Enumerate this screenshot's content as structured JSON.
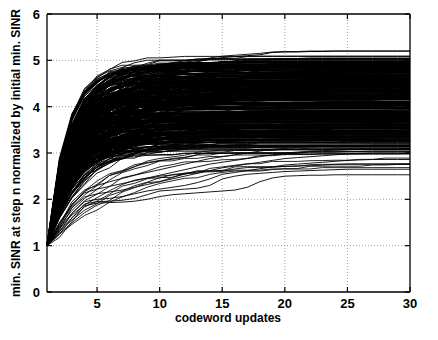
{
  "chart_data": {
    "type": "line",
    "title": "",
    "subtitle": "",
    "xlabel": "codeword updates",
    "ylabel": "min. SINR at step n normalized by initial min. SINR",
    "xlim": [
      1,
      30
    ],
    "ylim": [
      0,
      6
    ],
    "xticks": [
      5,
      10,
      15,
      20,
      25,
      30
    ],
    "xticklabels": [
      "5",
      "10",
      "15",
      "20",
      "25",
      "30"
    ],
    "yticks": [
      0,
      1,
      2,
      3,
      4,
      5,
      6
    ],
    "yticklabels": [
      "0",
      "1",
      "2",
      "3",
      "4",
      "5",
      "6"
    ],
    "grid": true,
    "grid_style": "dotted",
    "legend": "none",
    "line_color": "#000000",
    "background": "#ffffff",
    "n_series": 200,
    "series_note": "Approximately 200 overlapping monotone non-decreasing trajectories, all starting at (1, 1.0) and saturating by about step 20; they form a dense black band.",
    "x": [
      1,
      2,
      3,
      4,
      5,
      6,
      7,
      8,
      9,
      10,
      11,
      12,
      13,
      14,
      15,
      16,
      17,
      18,
      19,
      20,
      21,
      22,
      23,
      24,
      25,
      26,
      27,
      28,
      29,
      30
    ],
    "envelope_upper": [
      1.0,
      1.95,
      3.05,
      3.7,
      3.95,
      4.15,
      4.35,
      4.55,
      4.78,
      4.82,
      4.86,
      4.92,
      4.97,
      5.02,
      5.06,
      5.08,
      5.1,
      5.12,
      5.17,
      5.18,
      5.18,
      5.19,
      5.19,
      5.2,
      5.2,
      5.2,
      5.2,
      5.2,
      5.2,
      5.2
    ],
    "envelope_lower": [
      1.0,
      1.22,
      1.55,
      1.88,
      1.93,
      1.95,
      1.97,
      1.99,
      2.02,
      2.06,
      2.1,
      2.14,
      2.18,
      2.22,
      2.28,
      2.33,
      2.38,
      2.43,
      2.48,
      2.5,
      2.51,
      2.52,
      2.52,
      2.53,
      2.53,
      2.53,
      2.53,
      2.53,
      2.53,
      2.53
    ],
    "band_core_upper": [
      1.0,
      1.9,
      2.95,
      3.62,
      3.85,
      4.02,
      4.22,
      4.42,
      4.66,
      4.72,
      4.78,
      4.84,
      4.89,
      4.93,
      4.96,
      4.98,
      5.0,
      5.01,
      5.03,
      5.04,
      5.04,
      5.05,
      5.05,
      5.05,
      5.05,
      5.05,
      5.05,
      5.05,
      5.05,
      5.05
    ],
    "band_core_lower": [
      1.0,
      1.45,
      2.0,
      2.25,
      2.35,
      2.44,
      2.52,
      2.6,
      2.68,
      2.74,
      2.8,
      2.85,
      2.9,
      2.94,
      2.97,
      3.0,
      3.02,
      3.04,
      3.06,
      3.07,
      3.08,
      3.08,
      3.09,
      3.09,
      3.1,
      3.1,
      3.1,
      3.1,
      3.1,
      3.1
    ],
    "median": [
      1.0,
      1.7,
      2.5,
      3.05,
      3.25,
      3.42,
      3.6,
      3.78,
      3.96,
      4.06,
      4.15,
      4.23,
      4.3,
      4.36,
      4.41,
      4.45,
      4.48,
      4.51,
      4.54,
      4.56,
      4.57,
      4.58,
      4.59,
      4.6,
      4.6,
      4.61,
      4.61,
      4.61,
      4.61,
      4.61
    ],
    "outlier_series": [
      {
        "name": "outlier-1",
        "values": [
          1.0,
          1.18,
          1.52,
          1.86,
          1.92,
          1.93,
          1.94,
          1.96,
          2.0,
          2.06,
          2.1,
          2.12,
          2.14,
          2.16,
          2.18,
          2.2,
          2.26,
          2.38,
          2.46,
          2.5,
          2.51,
          2.52,
          2.52,
          2.53,
          2.53,
          2.53,
          2.53,
          2.53,
          2.53,
          2.53
        ]
      },
      {
        "name": "outlier-2",
        "values": [
          1.0,
          1.25,
          1.6,
          1.9,
          1.95,
          1.96,
          1.98,
          2.02,
          2.1,
          2.18,
          2.2,
          2.22,
          2.24,
          2.3,
          2.44,
          2.5,
          2.54,
          2.56,
          2.58,
          2.6,
          2.61,
          2.62,
          2.63,
          2.64,
          2.65,
          2.65,
          2.65,
          2.65,
          2.65,
          2.65
        ]
      },
      {
        "name": "outlier-3",
        "values": [
          1.0,
          1.3,
          1.7,
          1.95,
          2.0,
          2.02,
          2.06,
          2.12,
          2.18,
          2.22,
          2.26,
          2.3,
          2.36,
          2.44,
          2.54,
          2.58,
          2.62,
          2.66,
          2.7,
          2.74,
          2.76,
          2.78,
          2.8,
          2.82,
          2.84,
          2.85,
          2.86,
          2.86,
          2.86,
          2.86
        ]
      },
      {
        "name": "outlier-4",
        "values": [
          1.0,
          1.35,
          1.82,
          2.05,
          2.12,
          2.16,
          2.2,
          2.26,
          2.32,
          2.38,
          2.44,
          2.5,
          2.56,
          2.62,
          2.68,
          2.72,
          2.76,
          2.8,
          2.84,
          2.88,
          2.9,
          2.92,
          2.94,
          2.96,
          2.98,
          2.99,
          3.0,
          3.0,
          3.0,
          3.0
        ]
      },
      {
        "name": "outlier-5",
        "values": [
          1.0,
          1.4,
          1.9,
          2.14,
          2.22,
          2.28,
          2.34,
          2.4,
          2.46,
          2.52,
          2.58,
          2.64,
          2.7,
          2.76,
          2.8,
          2.84,
          2.88,
          2.92,
          2.96,
          3.0,
          3.02,
          3.04,
          3.05,
          3.06,
          3.07,
          3.08,
          3.08,
          3.08,
          3.08,
          3.08
        ]
      },
      {
        "name": "outlier-6",
        "values": [
          1.0,
          1.45,
          1.95,
          2.2,
          2.3,
          2.38,
          2.45,
          2.52,
          2.58,
          2.64,
          2.7,
          2.76,
          2.82,
          2.88,
          2.92,
          2.96,
          3.0,
          3.04,
          3.08,
          3.1,
          3.12,
          3.13,
          3.14,
          3.15,
          3.16,
          3.16,
          3.17,
          3.17,
          3.17,
          3.17
        ]
      },
      {
        "name": "outlier-top-1",
        "values": [
          1.0,
          1.98,
          3.1,
          3.75,
          4.0,
          4.2,
          4.4,
          4.6,
          4.82,
          4.86,
          4.9,
          4.96,
          5.0,
          5.05,
          5.09,
          5.11,
          5.13,
          5.15,
          5.18,
          5.19,
          5.19,
          5.2,
          5.2,
          5.2,
          5.2,
          5.2,
          5.2,
          5.2,
          5.2,
          5.2
        ]
      }
    ]
  },
  "axes": {
    "x_axis_name": "codeword updates",
    "y_axis_name": "min. SINR at step n normalized by initial min. SINR"
  }
}
